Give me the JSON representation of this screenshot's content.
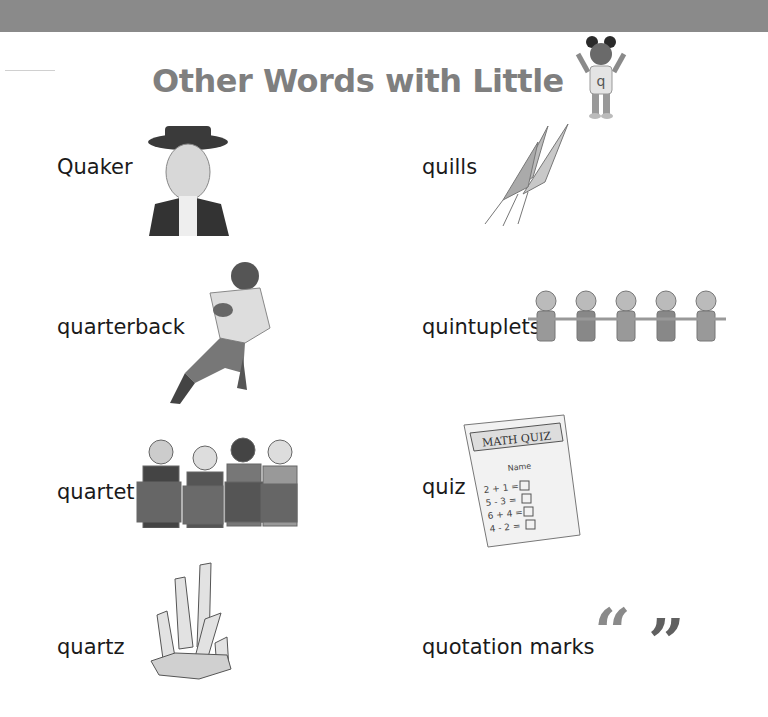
{
  "header": {
    "title": "Other Words with Little",
    "mascot_letter": "q"
  },
  "words": [
    {
      "label": "Quaker",
      "illustration": "quaker-man-portrait"
    },
    {
      "label": "quills",
      "illustration": "feather-quills"
    },
    {
      "label": "quarterback",
      "illustration": "football-player-running"
    },
    {
      "label": "quintuplets",
      "illustration": "five-children-holding-hands"
    },
    {
      "label": "quartet",
      "illustration": "four-singers-choir"
    },
    {
      "label": "quiz",
      "illustration": "math-quiz-paper"
    },
    {
      "label": "quartz",
      "illustration": "quartz-crystal-cluster"
    },
    {
      "label": "quotation marks",
      "illustration": "quotation-marks-glyphs"
    }
  ],
  "quiz_sheet": {
    "heading": "MATH QUIZ",
    "name_label": "Name",
    "problems": [
      "2 + 1 =",
      "5 - 3 =",
      "6 + 4 =",
      "4 - 2 ="
    ]
  },
  "quote_glyphs": {
    "open": "“",
    "close": "”"
  },
  "colors": {
    "topbar": "#8a8a8a",
    "title": "#7f7f7f",
    "text": "#1a1a1a"
  }
}
